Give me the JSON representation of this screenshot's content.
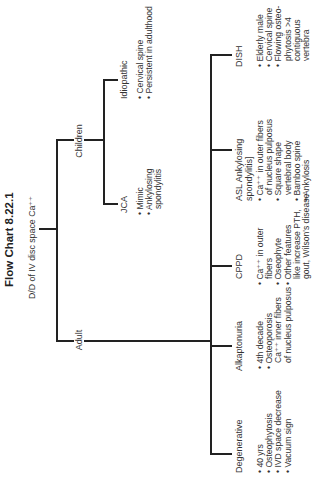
{
  "figure": {
    "title": "Flow Chart 8.22.1",
    "orientation": "rotated 90deg counter-clockwise"
  },
  "root": {
    "label": "D/D of IV disc space Ca⁺⁺"
  },
  "branches": {
    "children": {
      "label": "Children",
      "nodes": [
        {
          "label": "JCA",
          "bullets": [
            "• Mimic",
            "• Ankylosing",
            "spondylitis"
          ]
        },
        {
          "label": "Idiopathic",
          "bullets": [
            "• Cervical spine",
            "• Persistent in adulthood"
          ]
        }
      ]
    },
    "adult": {
      "label": "Adult",
      "nodes": [
        {
          "label": "Degenerative",
          "bullets": [
            "• 40 yrs",
            "• Osteophytosis",
            "• IVD space decrease",
            "• Vacuum sign"
          ]
        },
        {
          "label": "Alkaptonuria",
          "bullets": [
            "• 4th decade",
            "• Osteoporosis",
            "Ca⁺⁺ inner fibers",
            "of nucleus pulposus"
          ]
        },
        {
          "label": "CPPD",
          "bullets": [
            "• Ca⁺⁺ in outer",
            "fibers",
            "• Oseophyte",
            "• Other features",
            "like increase PTH,",
            "gout, Wilson's disease"
          ]
        },
        {
          "label_line1": "ASL Ankylosing",
          "label_line2": "spondylitis]",
          "bullets": [
            "• Ca⁺⁺ in outer fibers",
            "of nucleus pulposus",
            "• Square shape",
            "vertebral body",
            "• Bamboo spine",
            "• Ankylosis"
          ]
        },
        {
          "label": "DISH",
          "bullets": [
            "• Elderly male",
            "• Cervical spine",
            "• Flowing osteo-",
            "phytosis >4",
            "contiguous",
            "vertebra"
          ]
        }
      ]
    }
  },
  "colors": {
    "line": "#222222",
    "text": "#333333",
    "background": "#ffffff"
  }
}
